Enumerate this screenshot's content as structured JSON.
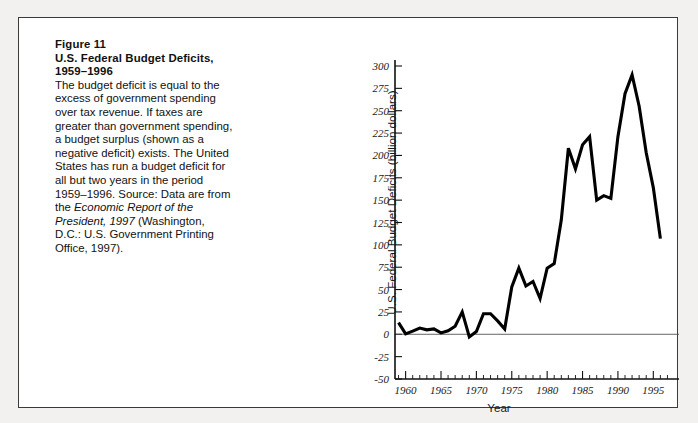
{
  "figure": {
    "caption_title_lines": [
      "Figure 11",
      "U.S. Federal Budget Deficits,",
      "1959–1996"
    ],
    "caption_body": "The budget deficit is equal to the excess of government spending over tax revenue. If taxes are greater than government spending, a budget surplus (shown as a negative deficit) exists. The United States has run a budget deficit for all but two years in the period 1959–1996. Source: Data are from the ",
    "caption_source_italic": "Economic Report of the President, 1997",
    "caption_body_tail": " (Washington, D.C.: U.S. Government Printing Office, 1997)."
  },
  "colors": {
    "line": "#000000",
    "axis": "#111111",
    "zero_line": "#555555",
    "frame": "#3a3a3a",
    "page_background": "#f2f1ef",
    "figure_background": "#ffffff"
  },
  "chart_data": {
    "type": "line",
    "title": "U.S. Federal Budget Deficits, 1959–1996",
    "xlabel": "Year",
    "ylabel": "U.S. Federal Budget Deficits (billion dollars)",
    "xlim": [
      1958.5,
      1997.5
    ],
    "ylim": [
      -50,
      300
    ],
    "ytick_values": [
      -50,
      -25,
      0,
      25,
      50,
      75,
      100,
      125,
      150,
      175,
      200,
      225,
      250,
      275,
      300
    ],
    "ytick_labels": [
      "-50",
      "-25",
      "0",
      "25",
      "50",
      "75",
      "100",
      "125",
      "150",
      "175",
      "200",
      "225",
      "250",
      "275",
      "300"
    ],
    "xtick_major_values": [
      1960,
      1965,
      1970,
      1975,
      1980,
      1985,
      1990,
      1995
    ],
    "xtick_major_labels": [
      "1960",
      "1965",
      "1970",
      "1975",
      "1980",
      "1985",
      "1990",
      "1995"
    ],
    "xtick_minor_step": 1,
    "grid": false,
    "legend": null,
    "x": [
      1959,
      1960,
      1961,
      1962,
      1963,
      1964,
      1965,
      1966,
      1967,
      1968,
      1969,
      1970,
      1971,
      1972,
      1973,
      1974,
      1975,
      1976,
      1977,
      1978,
      1979,
      1980,
      1981,
      1982,
      1983,
      1984,
      1985,
      1986,
      1987,
      1988,
      1989,
      1990,
      1991,
      1992,
      1993,
      1994,
      1995,
      1996
    ],
    "values": [
      -13,
      -0.5,
      -3.5,
      -7,
      -5,
      -6,
      -1.5,
      -4,
      -9,
      -25,
      3,
      -3,
      -23,
      -23,
      -15,
      -6,
      -53,
      -74,
      -54,
      -59,
      -40,
      -74,
      -79,
      -128,
      -208,
      -185,
      -212,
      -221,
      -150,
      -155,
      -152,
      -221,
      -269,
      -290,
      -255,
      -203,
      -164,
      -107
    ],
    "values_as_plotted_deficit": [
      13,
      0.5,
      3.5,
      7,
      5,
      6,
      1.5,
      4,
      9,
      25,
      -3,
      3,
      23,
      23,
      15,
      6,
      53,
      74,
      54,
      59,
      40,
      74,
      79,
      128,
      208,
      185,
      212,
      221,
      150,
      155,
      152,
      221,
      269,
      290,
      255,
      203,
      164,
      107
    ],
    "annotations": []
  }
}
